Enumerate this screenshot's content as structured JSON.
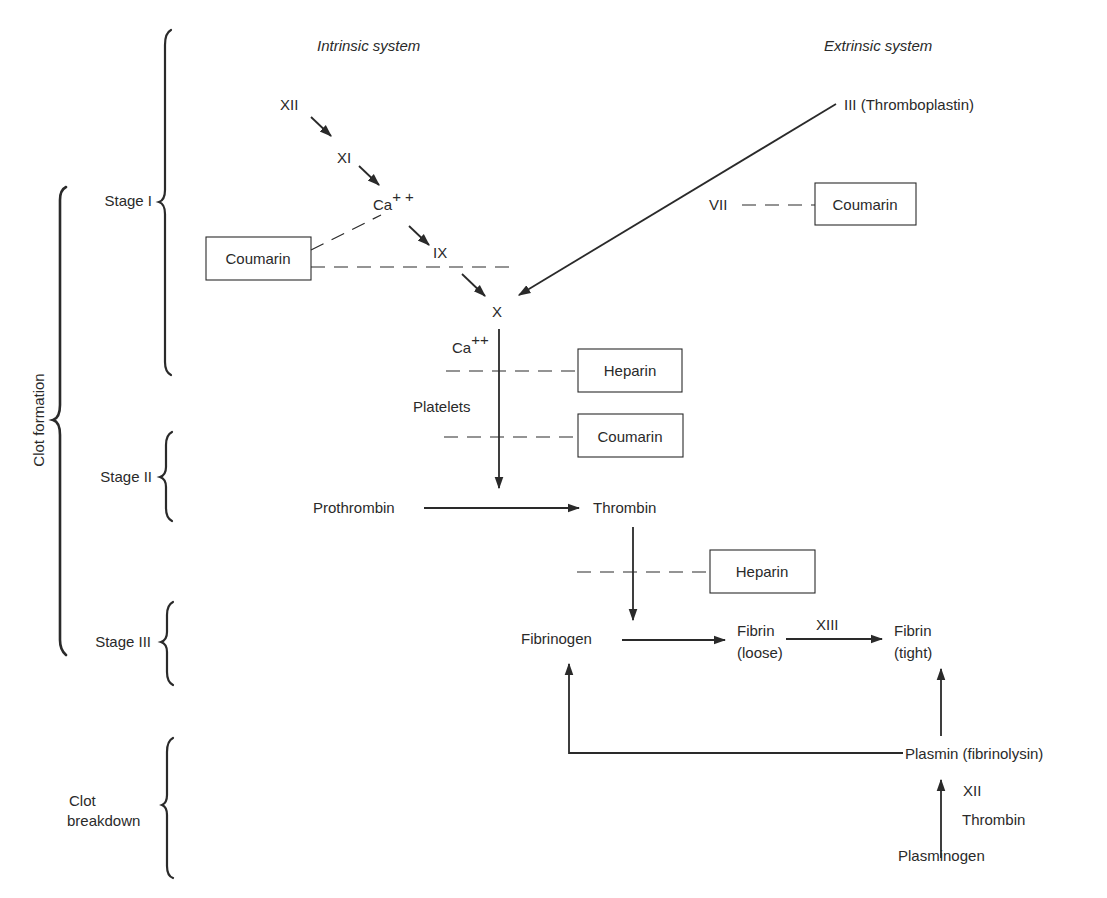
{
  "headers": {
    "intrinsic": "Intrinsic system",
    "extrinsic": "Extrinsic system"
  },
  "phases": {
    "clot_formation": "Clot formation",
    "clot_breakdown_line1": "Clot",
    "clot_breakdown_line2": "breakdown",
    "stage1": "Stage I",
    "stage2": "Stage II",
    "stage3": "Stage III"
  },
  "factors": {
    "xii": "XII",
    "xi": "XI",
    "ca1": "Ca",
    "ca1_sup": "+ +",
    "ix": "IX",
    "x": "X",
    "iii": "III (Thromboplastin)",
    "vii": "VII",
    "ca2": "Ca",
    "ca2_sup": "++",
    "platelets": "Platelets",
    "prothrombin": "Prothrombin",
    "thrombin": "Thrombin",
    "fibrinogen": "Fibrinogen",
    "fibrin_loose_1": "Fibrin",
    "fibrin_loose_2": "(loose)",
    "xiii": "XIII",
    "fibrin_tight_1": "Fibrin",
    "fibrin_tight_2": "(tight)",
    "plasmin": "Plasmin (fibrinolysin)",
    "xii_breakdown": "XII",
    "thrombin_breakdown": "Thrombin",
    "plasminogen": "Plasminogen"
  },
  "inhibitors": {
    "coumarin_intrinsic": "Coumarin",
    "coumarin_extrinsic": "Coumarin",
    "heparin_stage1": "Heparin",
    "coumarin_stage1": "Coumarin",
    "heparin_stage2": "Heparin"
  },
  "colors": {
    "ink": "#2a2a2a",
    "background": "#ffffff"
  }
}
